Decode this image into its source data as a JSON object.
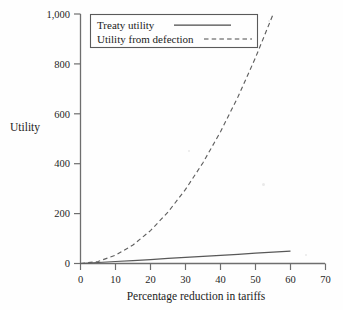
{
  "chart_data": {
    "type": "line",
    "title": "",
    "subtitle": "",
    "xlabel": "Percentage reduction in tariffs",
    "ylabel": "Utility",
    "xlim": [
      0,
      70
    ],
    "ylim": [
      0,
      1000
    ],
    "xticks": [
      "0",
      "10",
      "20",
      "30",
      "40",
      "50",
      "60",
      "70"
    ],
    "xtick_values": [
      0,
      10,
      20,
      30,
      40,
      50,
      60,
      70
    ],
    "yticks": [
      "0",
      "200",
      "400",
      "600",
      "800",
      "1,000"
    ],
    "ytick_values": [
      0,
      200,
      400,
      600,
      800,
      1000
    ],
    "grid": false,
    "legend_position": "top-left",
    "x": [
      0,
      5,
      10,
      15,
      20,
      25,
      30,
      35,
      40,
      45,
      50,
      55,
      60
    ],
    "series": [
      {
        "name": "Treaty utility",
        "style": "solid",
        "color": "#555555",
        "values": [
          0,
          4,
          8,
          12,
          16,
          21,
          25,
          29,
          33,
          37,
          42,
          46,
          50
        ]
      },
      {
        "name": "Utility from defection",
        "style": "dashed",
        "color": "#555555",
        "values": [
          0,
          8,
          33,
          74,
          132,
          206,
          297,
          404,
          528,
          668,
          825,
          998,
          null
        ]
      }
    ],
    "annotations": []
  },
  "legend": {
    "entries": [
      {
        "label": "Treaty utility",
        "style": "solid"
      },
      {
        "label": "Utility from defection",
        "style": "dashed"
      }
    ]
  },
  "axes": {
    "y_title": "Utility",
    "x_title": "Percentage reduction in tariffs"
  }
}
